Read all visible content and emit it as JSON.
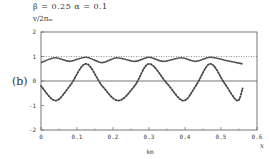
{
  "header": {
    "params": "β = 0.25   α = 0.1",
    "ylabel": "v/2πₘ",
    "panel_label": "(b)"
  },
  "chart_data": {
    "type": "line",
    "title": "",
    "params": {
      "beta": 0.25,
      "alpha": 0.1
    },
    "xlabel": "x (km)",
    "ylabel": "v/2π_m",
    "xlim": [
      0,
      0.6
    ],
    "ylim": [
      -2,
      2
    ],
    "xticks": [
      "0",
      "0.1",
      "0.2",
      "0.3",
      "0.4",
      "0.5",
      "0.6"
    ],
    "yticks": [
      "-2",
      "-1",
      "0",
      "1",
      "2"
    ],
    "x_unit_label": "km",
    "x_axis_symbol": "x",
    "grid": false,
    "series": [
      {
        "name": "reference (dotted, y=1)",
        "style": "dotted",
        "x": [
          0,
          0.6
        ],
        "values": [
          1,
          1
        ]
      },
      {
        "name": "upper curve",
        "style": "solid",
        "x": [
          0.0,
          0.04,
          0.08,
          0.125,
          0.17,
          0.21,
          0.26,
          0.3,
          0.34,
          0.39,
          0.43,
          0.47,
          0.51,
          0.56
        ],
        "values": [
          0.75,
          0.95,
          0.8,
          0.97,
          0.75,
          0.95,
          0.8,
          0.97,
          0.8,
          0.95,
          0.8,
          0.97,
          0.85,
          0.7
        ]
      },
      {
        "name": "lower curve",
        "style": "dotted-thick",
        "x": [
          0.0,
          0.04,
          0.08,
          0.125,
          0.17,
          0.215,
          0.26,
          0.3,
          0.35,
          0.395,
          0.43,
          0.47,
          0.51,
          0.545,
          0.56
        ],
        "values": [
          -0.2,
          -0.8,
          -0.2,
          0.7,
          -0.2,
          -0.8,
          -0.2,
          0.7,
          -0.1,
          -0.8,
          -0.2,
          0.7,
          -0.1,
          -0.8,
          -0.3
        ]
      }
    ]
  }
}
